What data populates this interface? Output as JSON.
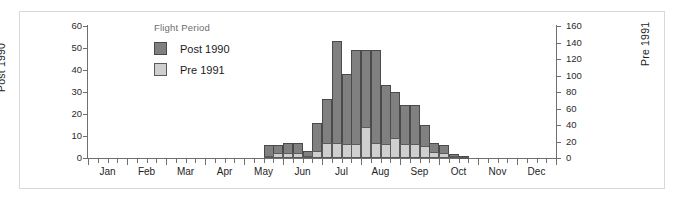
{
  "chart_data": {
    "type": "bar",
    "title": "",
    "subtitle": "",
    "xlabel": "",
    "ylabel": "Post 1990",
    "ylabel_right": "Pre 1991",
    "grid": false,
    "legend_title": "Flight Period",
    "legend_position": "inside-top-left",
    "bar_layout": "overlaid",
    "note": "Weekly bars. Dark bars read on left axis (Post 1990); light bars read on right axis (Pre 1991).",
    "x_major_ticks": [
      "Jan",
      "Feb",
      "Mar",
      "Apr",
      "May",
      "Jun",
      "Jul",
      "Aug",
      "Sep",
      "Oct",
      "Nov",
      "Dec"
    ],
    "x_minor_ticks_per_month": 4,
    "ylim_left": [
      0,
      60
    ],
    "ytick_left": [
      0,
      10,
      20,
      30,
      40,
      50,
      60
    ],
    "ylim_right": [
      0,
      160
    ],
    "ytick_right": [
      0,
      20,
      40,
      60,
      80,
      100,
      120,
      140,
      160
    ],
    "series": [
      {
        "name": "Post 1990",
        "axis": "left",
        "color": "#808080",
        "values": [
          0,
          0,
          0,
          0,
          0,
          0,
          0,
          0,
          0,
          0,
          0,
          0,
          0,
          0,
          0,
          0,
          0,
          0,
          6,
          6,
          7,
          7,
          3,
          16,
          27,
          53,
          38,
          49,
          49,
          49,
          33,
          30,
          24,
          24,
          15,
          7,
          6,
          2,
          1,
          0,
          0,
          0,
          0,
          0,
          0,
          0,
          0,
          0,
          0,
          0,
          0,
          0,
          0
        ]
      },
      {
        "name": "Pre 1991",
        "axis": "right",
        "color": "#cfcfcf",
        "values": [
          0,
          0,
          0,
          0,
          0,
          0,
          0,
          0,
          0,
          0,
          0,
          0,
          0,
          0,
          0,
          0,
          0,
          0,
          2,
          6,
          6,
          6,
          3,
          8,
          18,
          18,
          17,
          17,
          38,
          18,
          17,
          24,
          17,
          17,
          15,
          7,
          6,
          2,
          1,
          0,
          0,
          0,
          0,
          0,
          0,
          0,
          0,
          0,
          0,
          0,
          0,
          0,
          0
        ]
      }
    ],
    "bars": [
      {
        "week": 19,
        "post": 6,
        "pre": 2
      },
      {
        "week": 20,
        "post": 6,
        "pre": 6
      },
      {
        "week": 21,
        "post": 7,
        "pre": 6
      },
      {
        "week": 22,
        "post": 7,
        "pre": 6
      },
      {
        "week": 23,
        "post": 3,
        "pre": 3
      },
      {
        "week": 24,
        "post": 16,
        "pre": 8
      },
      {
        "week": 25,
        "post": 27,
        "pre": 18
      },
      {
        "week": 26,
        "post": 53,
        "pre": 18
      },
      {
        "week": 27,
        "post": 38,
        "pre": 17
      },
      {
        "week": 28,
        "post": 49,
        "pre": 17
      },
      {
        "week": 29,
        "post": 49,
        "pre": 38
      },
      {
        "week": 30,
        "post": 49,
        "pre": 18
      },
      {
        "week": 31,
        "post": 33,
        "pre": 17
      },
      {
        "week": 32,
        "post": 30,
        "pre": 24
      },
      {
        "week": 33,
        "post": 24,
        "pre": 17
      },
      {
        "week": 34,
        "post": 24,
        "pre": 17
      },
      {
        "week": 35,
        "post": 15,
        "pre": 15
      },
      {
        "week": 36,
        "post": 7,
        "pre": 7
      },
      {
        "week": 37,
        "post": 6,
        "pre": 6
      },
      {
        "week": 38,
        "post": 2,
        "pre": 2
      },
      {
        "week": 39,
        "post": 1,
        "pre": 1
      }
    ]
  },
  "axes": {
    "left": {
      "title": "Post 1990",
      "ticks": [
        "0",
        "10",
        "20",
        "30",
        "40",
        "50",
        "60"
      ]
    },
    "right": {
      "title": "Pre 1991",
      "ticks": [
        "0",
        "20",
        "40",
        "60",
        "80",
        "100",
        "120",
        "140",
        "160"
      ]
    },
    "x": {
      "labels": [
        "Jan",
        "Feb",
        "Mar",
        "Apr",
        "May",
        "Jun",
        "Jul",
        "Aug",
        "Sep",
        "Oct",
        "Nov",
        "Dec"
      ]
    }
  },
  "legend": {
    "title": "Flight Period",
    "items": [
      {
        "label": "Post 1990",
        "color": "#808080"
      },
      {
        "label": "Pre 1991",
        "color": "#cfcfcf"
      }
    ]
  }
}
